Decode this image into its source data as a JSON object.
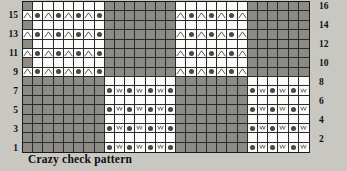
{
  "caption": "Crazy check pattern",
  "colors": {
    "page_background": "#c9c7c2",
    "shaded_cell": "#8d8b86",
    "white_cell": "#fbfbf9",
    "grid_line": "#2a2a2a",
    "border": "#1a1a1a",
    "text": "#111111"
  },
  "row_numbers_left": [
    "",
    "15",
    "",
    "13",
    "",
    "11",
    "",
    "9",
    "",
    "7",
    "",
    "5",
    "",
    "3",
    "",
    "1"
  ],
  "row_numbers_right": [
    "16",
    "",
    "14",
    "",
    "12",
    "",
    "10",
    "",
    "8",
    "",
    "6",
    "",
    "4",
    "",
    "2",
    ""
  ],
  "legend": {
    "caret_symbol": "caret-icon",
    "dot_symbol": "dot-icon",
    "vee_symbol": "vee-icon"
  },
  "chart_data": {
    "type": "heatmap",
    "title": "Crazy check pattern",
    "xlabel": "",
    "ylabel": "",
    "columns": 28,
    "rows": 16,
    "row_labels_left": [
      "",
      "15",
      "",
      "13",
      "",
      "11",
      "",
      "9",
      "",
      "7",
      "",
      "5",
      "",
      "3",
      "",
      "1"
    ],
    "row_labels_right": [
      "16",
      "",
      "14",
      "",
      "12",
      "",
      "10",
      "",
      "8",
      "",
      "6",
      "",
      "4",
      "",
      "2",
      ""
    ],
    "cell_shades": [
      [
        "sh",
        "wh",
        "wh",
        "wh",
        "wh",
        "wh",
        "wh",
        "wh",
        "sh",
        "sh",
        "sh",
        "sh",
        "sh",
        "sh",
        "sh",
        "wh",
        "wh",
        "wh",
        "wh",
        "wh",
        "wh",
        "wh",
        "sh",
        "sh",
        "sh",
        "sh",
        "sh",
        "sh"
      ],
      [
        "wh",
        "wh",
        "wh",
        "wh",
        "wh",
        "wh",
        "wh",
        "wh",
        "sh",
        "sh",
        "sh",
        "sh",
        "sh",
        "sh",
        "sh",
        "wh",
        "wh",
        "wh",
        "wh",
        "wh",
        "wh",
        "wh",
        "sh",
        "sh",
        "sh",
        "sh",
        "sh",
        "sh"
      ],
      [
        "sh",
        "wh",
        "wh",
        "wh",
        "wh",
        "wh",
        "wh",
        "wh",
        "sh",
        "sh",
        "sh",
        "sh",
        "sh",
        "sh",
        "sh",
        "wh",
        "wh",
        "wh",
        "wh",
        "wh",
        "wh",
        "wh",
        "sh",
        "sh",
        "sh",
        "sh",
        "sh",
        "sh"
      ],
      [
        "wh",
        "wh",
        "wh",
        "wh",
        "wh",
        "wh",
        "wh",
        "wh",
        "sh",
        "sh",
        "sh",
        "sh",
        "sh",
        "sh",
        "sh",
        "wh",
        "wh",
        "wh",
        "wh",
        "wh",
        "wh",
        "wh",
        "sh",
        "sh",
        "sh",
        "sh",
        "sh",
        "sh"
      ],
      [
        "sh",
        "wh",
        "wh",
        "wh",
        "wh",
        "wh",
        "wh",
        "wh",
        "sh",
        "sh",
        "sh",
        "sh",
        "sh",
        "sh",
        "sh",
        "wh",
        "wh",
        "wh",
        "wh",
        "wh",
        "wh",
        "wh",
        "sh",
        "sh",
        "sh",
        "sh",
        "sh",
        "sh"
      ],
      [
        "wh",
        "wh",
        "wh",
        "wh",
        "wh",
        "wh",
        "wh",
        "wh",
        "sh",
        "sh",
        "sh",
        "sh",
        "sh",
        "sh",
        "sh",
        "wh",
        "wh",
        "wh",
        "wh",
        "wh",
        "wh",
        "wh",
        "sh",
        "sh",
        "sh",
        "sh",
        "sh",
        "sh"
      ],
      [
        "sh",
        "wh",
        "wh",
        "wh",
        "wh",
        "wh",
        "wh",
        "wh",
        "sh",
        "sh",
        "sh",
        "sh",
        "sh",
        "sh",
        "sh",
        "wh",
        "wh",
        "wh",
        "wh",
        "wh",
        "wh",
        "wh",
        "sh",
        "sh",
        "sh",
        "sh",
        "sh",
        "sh"
      ],
      [
        "wh",
        "wh",
        "wh",
        "wh",
        "wh",
        "wh",
        "wh",
        "wh",
        "sh",
        "sh",
        "sh",
        "sh",
        "sh",
        "sh",
        "sh",
        "wh",
        "wh",
        "wh",
        "wh",
        "wh",
        "wh",
        "wh",
        "sh",
        "sh",
        "sh",
        "sh",
        "sh",
        "sh"
      ],
      [
        "sh",
        "sh",
        "sh",
        "sh",
        "sh",
        "sh",
        "sh",
        "sh",
        "wh",
        "wh",
        "wh",
        "wh",
        "wh",
        "wh",
        "wh",
        "sh",
        "sh",
        "sh",
        "sh",
        "sh",
        "sh",
        "sh",
        "wh",
        "wh",
        "wh",
        "wh",
        "wh",
        "wh"
      ],
      [
        "sh",
        "sh",
        "sh",
        "sh",
        "sh",
        "sh",
        "sh",
        "sh",
        "wh",
        "wh",
        "wh",
        "wh",
        "wh",
        "wh",
        "wh",
        "sh",
        "sh",
        "sh",
        "sh",
        "sh",
        "sh",
        "sh",
        "wh",
        "wh",
        "wh",
        "wh",
        "wh",
        "wh"
      ],
      [
        "sh",
        "sh",
        "sh",
        "sh",
        "sh",
        "sh",
        "sh",
        "sh",
        "wh",
        "wh",
        "wh",
        "wh",
        "wh",
        "wh",
        "wh",
        "sh",
        "sh",
        "sh",
        "sh",
        "sh",
        "sh",
        "sh",
        "wh",
        "wh",
        "wh",
        "wh",
        "wh",
        "wh"
      ],
      [
        "sh",
        "sh",
        "sh",
        "sh",
        "sh",
        "sh",
        "sh",
        "sh",
        "wh",
        "wh",
        "wh",
        "wh",
        "wh",
        "wh",
        "wh",
        "sh",
        "sh",
        "sh",
        "sh",
        "sh",
        "sh",
        "sh",
        "wh",
        "wh",
        "wh",
        "wh",
        "wh",
        "wh"
      ],
      [
        "sh",
        "sh",
        "sh",
        "sh",
        "sh",
        "sh",
        "sh",
        "sh",
        "wh",
        "wh",
        "wh",
        "wh",
        "wh",
        "wh",
        "wh",
        "sh",
        "sh",
        "sh",
        "sh",
        "sh",
        "sh",
        "sh",
        "wh",
        "wh",
        "wh",
        "wh",
        "wh",
        "wh"
      ],
      [
        "sh",
        "sh",
        "sh",
        "sh",
        "sh",
        "sh",
        "sh",
        "sh",
        "wh",
        "wh",
        "wh",
        "wh",
        "wh",
        "wh",
        "wh",
        "sh",
        "sh",
        "sh",
        "sh",
        "sh",
        "sh",
        "sh",
        "wh",
        "wh",
        "wh",
        "wh",
        "wh",
        "wh"
      ],
      [
        "sh",
        "sh",
        "sh",
        "sh",
        "sh",
        "sh",
        "sh",
        "sh",
        "wh",
        "wh",
        "wh",
        "wh",
        "wh",
        "wh",
        "wh",
        "sh",
        "sh",
        "sh",
        "sh",
        "sh",
        "sh",
        "sh",
        "wh",
        "wh",
        "wh",
        "wh",
        "wh",
        "wh"
      ],
      [
        "sh",
        "sh",
        "sh",
        "sh",
        "sh",
        "sh",
        "sh",
        "sh",
        "wh",
        "wh",
        "wh",
        "wh",
        "wh",
        "wh",
        "wh",
        "sh",
        "sh",
        "sh",
        "sh",
        "sh",
        "sh",
        "sh",
        "wh",
        "wh",
        "wh",
        "wh",
        "wh",
        "wh"
      ]
    ],
    "cell_symbols": [
      [
        "",
        "",
        "",
        "",
        "",
        "",
        "",
        "",
        "",
        "",
        "",
        "",
        "",
        "",
        "",
        "",
        "",
        "",
        "",
        "",
        "",
        "",
        "",
        "",
        "",
        "",
        "",
        ""
      ],
      [
        "caret",
        "dot",
        "caret",
        "dot",
        "caret",
        "dot",
        "caret",
        "dot",
        "",
        "",
        "",
        "",
        "",
        "",
        "",
        "caret",
        "dot",
        "caret",
        "dot",
        "caret",
        "dot",
        "caret",
        "",
        "",
        "",
        "",
        "",
        ""
      ],
      [
        "",
        "",
        "",
        "",
        "",
        "",
        "",
        "",
        "",
        "",
        "",
        "",
        "",
        "",
        "",
        "",
        "",
        "",
        "",
        "",
        "",
        "",
        "",
        "",
        "",
        "",
        "",
        ""
      ],
      [
        "caret",
        "dot",
        "caret",
        "dot",
        "caret",
        "dot",
        "caret",
        "dot",
        "",
        "",
        "",
        "",
        "",
        "",
        "",
        "caret",
        "dot",
        "caret",
        "dot",
        "caret",
        "dot",
        "caret",
        "",
        "",
        "",
        "",
        "",
        ""
      ],
      [
        "",
        "",
        "",
        "",
        "",
        "",
        "",
        "",
        "",
        "",
        "",
        "",
        "",
        "",
        "",
        "",
        "",
        "",
        "",
        "",
        "",
        "",
        "",
        "",
        "",
        "",
        "",
        ""
      ],
      [
        "caret",
        "dot",
        "caret",
        "dot",
        "caret",
        "dot",
        "caret",
        "dot",
        "",
        "",
        "",
        "",
        "",
        "",
        "",
        "caret",
        "dot",
        "caret",
        "dot",
        "caret",
        "dot",
        "caret",
        "",
        "",
        "",
        "",
        "",
        ""
      ],
      [
        "",
        "",
        "",
        "",
        "",
        "",
        "",
        "",
        "",
        "",
        "",
        "",
        "",
        "",
        "",
        "",
        "",
        "",
        "",
        "",
        "",
        "",
        "",
        "",
        "",
        "",
        "",
        ""
      ],
      [
        "caret",
        "dot",
        "caret",
        "dot",
        "caret",
        "dot",
        "caret",
        "dot",
        "",
        "",
        "",
        "",
        "",
        "",
        "",
        "caret",
        "dot",
        "caret",
        "dot",
        "caret",
        "dot",
        "caret",
        "",
        "",
        "",
        "",
        "",
        ""
      ],
      [
        "",
        "",
        "",
        "",
        "",
        "",
        "",
        "",
        "",
        "",
        "",
        "",
        "",
        "",
        "",
        "",
        "",
        "",
        "",
        "",
        "",
        "",
        "",
        "",
        "",
        "",
        "",
        ""
      ],
      [
        "",
        "",
        "",
        "",
        "",
        "",
        "",
        "",
        "dot",
        "vee",
        "dot",
        "vee",
        "dot",
        "vee",
        "dot",
        "",
        "",
        "",
        "",
        "",
        "",
        "",
        "dot",
        "vee",
        "dot",
        "vee",
        "dot",
        "vee"
      ],
      [
        "",
        "",
        "",
        "",
        "",
        "",
        "",
        "",
        "",
        "",
        "",
        "",
        "",
        "",
        "",
        "",
        "",
        "",
        "",
        "",
        "",
        "",
        "",
        "",
        "",
        "",
        "",
        ""
      ],
      [
        "",
        "",
        "",
        "",
        "",
        "",
        "",
        "",
        "dot",
        "vee",
        "dot",
        "vee",
        "dot",
        "vee",
        "dot",
        "",
        "",
        "",
        "",
        "",
        "",
        "",
        "dot",
        "vee",
        "dot",
        "vee",
        "dot",
        "vee"
      ],
      [
        "",
        "",
        "",
        "",
        "",
        "",
        "",
        "",
        "",
        "",
        "",
        "",
        "",
        "",
        "",
        "",
        "",
        "",
        "",
        "",
        "",
        "",
        "",
        "",
        "",
        "",
        "",
        ""
      ],
      [
        "",
        "",
        "",
        "",
        "",
        "",
        "",
        "",
        "dot",
        "vee",
        "dot",
        "vee",
        "dot",
        "vee",
        "dot",
        "",
        "",
        "",
        "",
        "",
        "",
        "",
        "dot",
        "vee",
        "dot",
        "vee",
        "dot",
        "vee"
      ],
      [
        "",
        "",
        "",
        "",
        "",
        "",
        "",
        "",
        "",
        "",
        "",
        "",
        "",
        "",
        "",
        "",
        "",
        "",
        "",
        "",
        "",
        "",
        "",
        "",
        "",
        "",
        "",
        ""
      ],
      [
        "",
        "",
        "",
        "",
        "",
        "",
        "",
        "",
        "dot",
        "vee",
        "dot",
        "vee",
        "dot",
        "vee",
        "dot",
        "",
        "",
        "",
        "",
        "",
        "",
        "",
        "dot",
        "vee",
        "dot",
        "vee",
        "dot",
        "vee"
      ]
    ]
  }
}
